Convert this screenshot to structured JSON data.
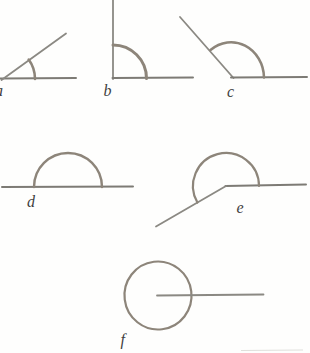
{
  "colors": {
    "background": "#fefefd",
    "line": "#8b8983",
    "line_dark": "#7d7b75",
    "arc": "#8d857a",
    "label": "#3f3f3f"
  },
  "figures": [
    {
      "id": "a",
      "label": "a"
    },
    {
      "id": "b",
      "label": "b"
    },
    {
      "id": "c",
      "label": "c"
    },
    {
      "id": "d",
      "label": "d"
    },
    {
      "id": "e",
      "label": "e"
    },
    {
      "id": "f",
      "label": "f"
    }
  ]
}
